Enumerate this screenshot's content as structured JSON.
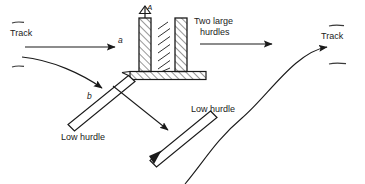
{
  "figure": {
    "type": "diagram",
    "background_color": "#ffffff",
    "stroke_color": "#1a1a1a",
    "labels": {
      "track_left": "Track",
      "track_right": "Track",
      "two_large_hurdles": "Two large\nhurdles",
      "two_large_hurdles_line1": "Two large",
      "two_large_hurdles_line2": "hurdles",
      "low_hurdle_left": "Low hurdle",
      "low_hurdle_right": "Low hurdle",
      "path_a": "a",
      "path_b": "b",
      "marker_a": "A"
    },
    "elements": [
      {
        "name": "track-left-label",
        "text": "Track"
      },
      {
        "name": "track-left-dash-top",
        "text": ""
      },
      {
        "name": "track-left-dash-bottom",
        "text": ""
      },
      {
        "name": "track-right-label",
        "text": "Track"
      },
      {
        "name": "track-right-dash-top",
        "text": ""
      },
      {
        "name": "track-right-dash-bottom",
        "text": ""
      },
      {
        "name": "path-a-arrow",
        "text": "a"
      },
      {
        "name": "path-b-curve-arrow",
        "text": "b"
      },
      {
        "name": "large-hurdle-left-pillar",
        "text": ""
      },
      {
        "name": "large-hurdle-right-pillar",
        "text": ""
      },
      {
        "name": "large-hurdle-base",
        "text": ""
      },
      {
        "name": "flag-marker-a",
        "text": "A"
      },
      {
        "name": "low-hurdle-left-bar",
        "text": ""
      },
      {
        "name": "low-hurdle-right-bar",
        "text": ""
      },
      {
        "name": "exit-arrow-straight",
        "text": ""
      },
      {
        "name": "exit-curve-arrow",
        "text": ""
      },
      {
        "name": "mid-diagonal-arrow",
        "text": ""
      }
    ]
  }
}
